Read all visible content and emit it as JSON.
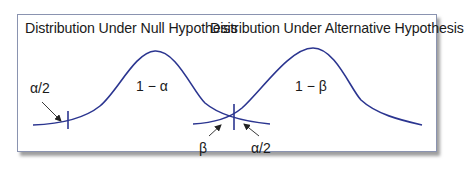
{
  "diagram": {
    "titles": {
      "null": "Distribution Under Null Hypothesis",
      "alternative": "Distribution Under Alternative Hypothesis"
    },
    "labels": {
      "left_tail": "α/2",
      "null_body": "1 − α",
      "alt_body": "1 − β",
      "beta": "β",
      "right_tail": "α/2"
    },
    "colors": {
      "curve": "#2b3590",
      "arrow": "#222222",
      "border": "#8a93b0",
      "text": "#1a1a1a"
    }
  }
}
